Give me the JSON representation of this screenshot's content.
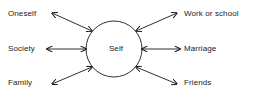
{
  "diagram": {
    "type": "radial-relationship-diagram",
    "center": {
      "id": "self",
      "label": "Self",
      "shape": "circle"
    },
    "colors": {
      "background": "#ffffff",
      "stroke": "#1a1a1a",
      "text": "#1a1a1a"
    },
    "nodes": [
      {
        "id": "oneself",
        "label": "Oneself",
        "position": "top-left",
        "arrow": "double-headed"
      },
      {
        "id": "society",
        "label": "Society",
        "position": "middle-left",
        "arrow": "double-headed"
      },
      {
        "id": "family",
        "label": "Family",
        "position": "bottom-left",
        "arrow": "double-headed"
      },
      {
        "id": "work",
        "label": "Work or school",
        "position": "top-right",
        "arrow": "double-headed"
      },
      {
        "id": "marriage",
        "label": "Marriage",
        "position": "middle-right",
        "arrow": "double-headed"
      },
      {
        "id": "friends",
        "label": "Friends",
        "position": "bottom-right",
        "arrow": "double-headed"
      }
    ]
  }
}
